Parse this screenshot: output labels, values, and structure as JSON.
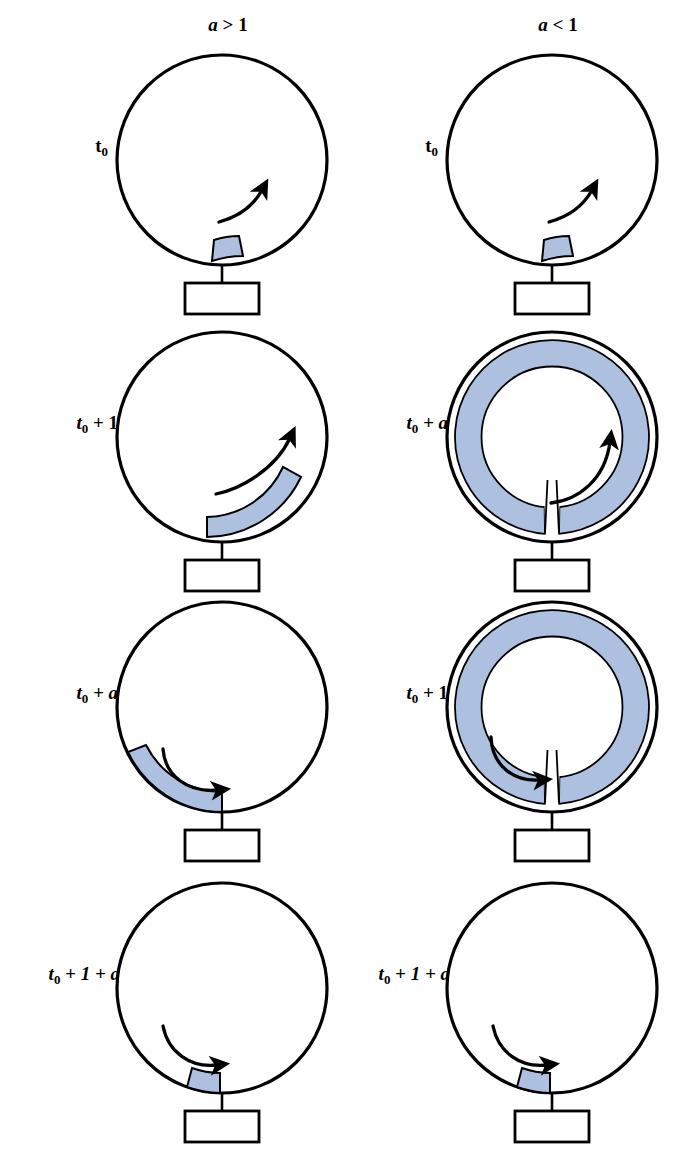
{
  "figure": {
    "background_color": "#ffffff",
    "stroke_color": "#000000",
    "fill_color": "#aec0e0",
    "fill_color_name": "light-steel-blue",
    "columns": [
      {
        "id": "left",
        "header_prefix": "a",
        "header_relation": ">",
        "header_value": "1",
        "header_text": "a > 1"
      },
      {
        "id": "right",
        "header_prefix": "a",
        "header_relation": "<",
        "header_value": "1",
        "header_text": "a < 1"
      }
    ],
    "rows": [
      {
        "index": 1,
        "left": {
          "label_main": "t",
          "label_sub": "0",
          "label_rest": "",
          "label_text": "t0",
          "shape": "circle",
          "arc_type": "short-segment",
          "arc_start_deg": 255,
          "arc_end_deg": 285,
          "arrow": "ccw-small-upright"
        },
        "right": {
          "label_main": "t",
          "label_sub": "0",
          "label_rest": "",
          "label_text": "t0",
          "shape": "circle",
          "arc_type": "short-segment",
          "arc_start_deg": 255,
          "arc_end_deg": 285,
          "arrow": "ccw-small-upright"
        }
      },
      {
        "index": 2,
        "left": {
          "label_main": "t",
          "label_sub": "0",
          "label_rest": " + 1",
          "label_text": "t0 + 1",
          "shape": "circle",
          "arc_type": "medium-segment",
          "arc_start_deg": 250,
          "arc_end_deg": 330,
          "arrow": "ccw-medium-upright"
        },
        "right": {
          "label_main": "t",
          "label_sub": "0",
          "label_rest": " + a",
          "label_rest_italic": true,
          "label_text": "t0 + a",
          "shape": "double-circle",
          "arc_type": "full-ring",
          "arc_gap_deg": 8,
          "arrow": "ccw-long-inner"
        }
      },
      {
        "index": 3,
        "left": {
          "label_main": "t",
          "label_sub": "0",
          "label_rest": " + a",
          "label_rest_italic": true,
          "label_text": "t0 + a",
          "shape": "circle",
          "arc_type": "medium-segment",
          "arc_start_deg": 165,
          "arc_end_deg": 250,
          "arrow": "cw-medium-left"
        },
        "right": {
          "label_main": "t",
          "label_sub": "0",
          "label_rest": " + 1",
          "label_text": "t0 + 1",
          "shape": "double-circle",
          "arc_type": "full-ring",
          "arc_gap_deg": 8,
          "arrow": "cw-medium-left"
        }
      },
      {
        "index": 4,
        "left": {
          "label_main": "t",
          "label_sub": "0",
          "label_rest": " + 1 + a",
          "label_rest_italic": true,
          "label_text": "t0 + 1 + a",
          "shape": "circle",
          "arc_type": "short-segment",
          "arc_start_deg": 250,
          "arc_end_deg": 276,
          "arrow": "cw-small-left"
        },
        "right": {
          "label_main": "t",
          "label_sub": "0",
          "label_rest": " + 1 + a",
          "label_rest_italic": true,
          "label_text": "t0 + 1 + a",
          "shape": "circle",
          "arc_type": "short-segment",
          "arc_start_deg": 250,
          "arc_end_deg": 276,
          "arrow": "cw-small-left"
        }
      }
    ]
  }
}
